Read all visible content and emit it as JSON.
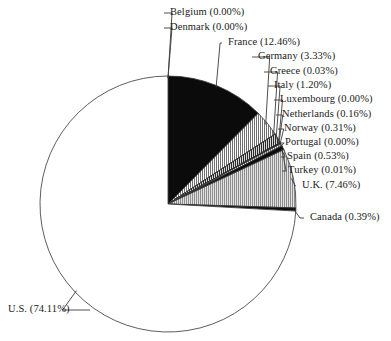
{
  "chart_data": {
    "type": "pie",
    "title": "",
    "legend_position": "callout-labels",
    "start_angle_deg": 0,
    "direction": "clockwise",
    "categories": [
      "Belgium",
      "Denmark",
      "France",
      "Germany",
      "Greece",
      "Italy",
      "Luxembourg",
      "Netherlands",
      "Norway",
      "Portugal",
      "Spain",
      "Turkey",
      "U.K.",
      "Canada",
      "U.S."
    ],
    "values": [
      0.0,
      0.0,
      12.46,
      3.33,
      0.03,
      1.2,
      0.0,
      0.16,
      0.31,
      0.0,
      0.53,
      0.01,
      7.46,
      0.39,
      74.11
    ],
    "value_unit": "%",
    "labels": [
      "Belgium (0.00%)",
      "Denmark (0.00%)",
      "France (12.46%)",
      "Germany (3.33%)",
      "Greece (0.03%)",
      "Italy (1.20%)",
      "Luxembourg (0.00%)",
      "Netherlands (0.16%)",
      "Norway (0.31%)",
      "Portugal (0.00%)",
      "Spain (0.53%)",
      "Turkey (0.01%)",
      "U.K. (7.46%)",
      "Canada (0.39%)",
      "U.S. (74.11%)"
    ],
    "slice_fills": [
      "white",
      "white",
      "black",
      "vertical-hatch-light",
      "black",
      "vertical-hatch-dark",
      "white",
      "black",
      "vertical-hatch-light",
      "white",
      "black",
      "white",
      "vertical-hatch-gray",
      "black",
      "white"
    ]
  },
  "colors": {
    "outline": "#333333",
    "black_fill": "#0b0b0b",
    "white_fill": "#ffffff",
    "hatch_gray": "#9a9a9a",
    "leader_line": "#3a3a3a",
    "text": "#1a1a1a",
    "background": "#ffffff"
  },
  "callouts": [
    {
      "key": "belgium",
      "text": "Belgium (0.00%)",
      "side": "right",
      "x": 170,
      "y": 8
    },
    {
      "key": "denmark",
      "text": "Denmark (0.00%)",
      "side": "right",
      "x": 170,
      "y": 23
    },
    {
      "key": "france",
      "text": "France (12.46%)",
      "side": "right",
      "x": 228,
      "y": 38
    },
    {
      "key": "germany",
      "text": "Germany (3.33%)",
      "side": "right",
      "x": 258,
      "y": 52
    },
    {
      "key": "greece",
      "text": "Greece (0.03%)",
      "side": "right",
      "x": 270,
      "y": 67
    },
    {
      "key": "italy",
      "text": "Italy (1.20%)",
      "side": "right",
      "x": 274,
      "y": 81
    },
    {
      "key": "luxembourg",
      "text": "Luxembourg (0.00%)",
      "side": "right",
      "x": 280,
      "y": 95
    },
    {
      "key": "netherlands",
      "text": "Netherlands (0.16%)",
      "side": "right",
      "x": 282,
      "y": 110
    },
    {
      "key": "norway",
      "text": "Norway (0.31%)",
      "side": "right",
      "x": 284,
      "y": 124
    },
    {
      "key": "portugal",
      "text": "Portugal (0.00%)",
      "side": "right",
      "x": 285,
      "y": 138
    },
    {
      "key": "spain",
      "text": "Spain (0.53%)",
      "side": "right",
      "x": 287,
      "y": 152
    },
    {
      "key": "turkey",
      "text": "Turkey (0.01%)",
      "side": "right",
      "x": 288,
      "y": 166
    },
    {
      "key": "uk",
      "text": "U.K. (7.46%)",
      "side": "right",
      "x": 302,
      "y": 181
    },
    {
      "key": "canada",
      "text": "Canada (0.39%)",
      "side": "right",
      "x": 310,
      "y": 213
    },
    {
      "key": "us",
      "text": "U.S. (74.11%)",
      "side": "left",
      "x": 8,
      "y": 305
    }
  ]
}
